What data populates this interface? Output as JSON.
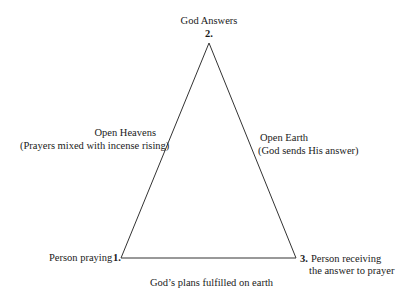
{
  "diagram": {
    "type": "triangle",
    "vertices": [
      {
        "number": "1.",
        "label": "Person praying"
      },
      {
        "number": "2.",
        "label": "God Answers"
      },
      {
        "number": "3.",
        "label_line1": "Person receiving",
        "label_line2": "the answer to prayer"
      }
    ],
    "edges": {
      "left": {
        "title": "Open Heavens",
        "subtitle": "(Prayers mixed with incense rising)"
      },
      "right": {
        "title": "Open Earth",
        "subtitle": "(God sends His answer)"
      },
      "bottom": {
        "title": "God’s plans fulfilled on earth"
      }
    },
    "line_color": "#333333"
  }
}
